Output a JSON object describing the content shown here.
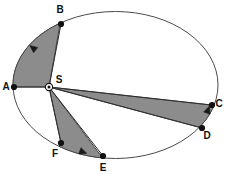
{
  "figure": {
    "background_color": "#ffffff",
    "outline_color": "#4a4a4a",
    "sector_fill_color": "#8c8c8c",
    "sector_stroke_color": "#3a3a3a",
    "label_color": "#111111"
  },
  "chart_data": {
    "type": "diagram",
    "title": "",
    "xlabel": "",
    "ylabel": "",
    "ellipse": {
      "center_x": 115.5,
      "center_y": 85,
      "radius_x": 102.5,
      "radius_y": 73.5,
      "rotation_deg": 0,
      "stroke": "#4a4a4a"
    },
    "focus": {
      "label": "S",
      "x": 49,
      "y": 87,
      "label_x": 59,
      "label_y": 80,
      "marker": "circled-dot"
    },
    "points": [
      {
        "label": "A",
        "x": 14,
        "y": 87,
        "label_x": 6,
        "label_y": 87
      },
      {
        "label": "B",
        "x": 61,
        "y": 24,
        "label_x": 60,
        "label_y": 10
      },
      {
        "label": "C",
        "x": 212,
        "y": 105,
        "label_x": 219,
        "label_y": 104
      },
      {
        "label": "D",
        "x": 202,
        "y": 128,
        "label_x": 207,
        "label_y": 136
      },
      {
        "label": "E",
        "x": 103,
        "y": 156,
        "label_x": 103,
        "label_y": 168
      },
      {
        "label": "F",
        "x": 61,
        "y": 143,
        "label_x": 55,
        "label_y": 154
      }
    ],
    "sectors": [
      {
        "name": "sector-ASB",
        "from_point": "A",
        "to_point": "B",
        "vertex": "S",
        "fill": "#8c8c8c",
        "description": "Shaded elliptical sector swept from B to A"
      },
      {
        "name": "sector-CSD",
        "from_point": "D",
        "to_point": "C",
        "vertex": "S",
        "fill": "#8c8c8c",
        "description": "Shaded elliptical sector swept from D to C"
      },
      {
        "name": "sector-ESF",
        "from_point": "F",
        "to_point": "E",
        "vertex": "S",
        "fill": "#8c8c8c",
        "description": "Shaded elliptical sector swept from F to E"
      }
    ],
    "arrows": [
      {
        "name": "arrow-B-to-A",
        "x": 33,
        "y": 48,
        "angle_deg": 218
      },
      {
        "name": "arrow-D-to-C",
        "x": 208,
        "y": 110,
        "angle_deg": 290
      },
      {
        "name": "arrow-F-to-E",
        "x": 83,
        "y": 152,
        "angle_deg": 20
      }
    ]
  }
}
